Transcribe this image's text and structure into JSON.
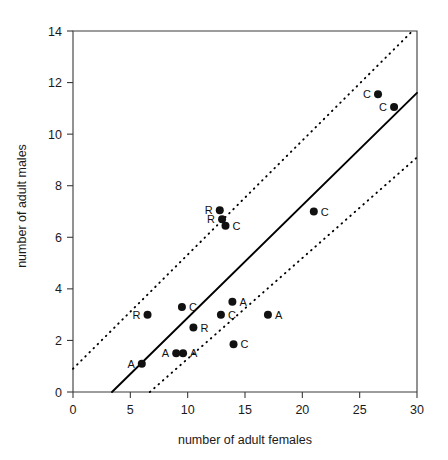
{
  "chart_data": {
    "type": "scatter",
    "title": "",
    "xlabel": "number of adult females",
    "ylabel": "number of adult males",
    "xlim": [
      0,
      30
    ],
    "ylim": [
      0,
      14
    ],
    "xticks": [
      0,
      5,
      10,
      15,
      20,
      25,
      30
    ],
    "yticks": [
      0,
      2,
      4,
      6,
      8,
      10,
      12,
      14
    ],
    "xtick_labels": [
      "0",
      "5",
      "10",
      "15",
      "20",
      "25",
      "30"
    ],
    "ytick_labels": [
      "0",
      "2",
      "4",
      "6",
      "8",
      "10",
      "12",
      "14"
    ],
    "grid": false,
    "legend": "none",
    "points": [
      {
        "x": 6.0,
        "y": 1.1,
        "label": "A",
        "label_side": "left"
      },
      {
        "x": 6.5,
        "y": 3.0,
        "label": "R",
        "label_side": "left"
      },
      {
        "x": 9.0,
        "y": 1.5,
        "label": "A",
        "label_side": "left"
      },
      {
        "x": 9.6,
        "y": 1.5,
        "label": "A",
        "label_side": "right"
      },
      {
        "x": 9.5,
        "y": 3.3,
        "label": "C",
        "label_side": "right"
      },
      {
        "x": 10.5,
        "y": 2.5,
        "label": "R",
        "label_side": "right"
      },
      {
        "x": 12.8,
        "y": 7.05,
        "label": "R",
        "label_side": "left"
      },
      {
        "x": 13.0,
        "y": 6.7,
        "label": "R",
        "label_side": "left"
      },
      {
        "x": 13.3,
        "y": 6.45,
        "label": "C",
        "label_side": "right"
      },
      {
        "x": 12.9,
        "y": 3.0,
        "label": "C",
        "label_side": "right"
      },
      {
        "x": 13.9,
        "y": 3.5,
        "label": "A",
        "label_side": "right"
      },
      {
        "x": 14.0,
        "y": 1.85,
        "label": "C",
        "label_side": "right"
      },
      {
        "x": 17.0,
        "y": 3.0,
        "label": "A",
        "label_side": "right"
      },
      {
        "x": 21.0,
        "y": 7.0,
        "label": "C",
        "label_side": "right"
      },
      {
        "x": 26.6,
        "y": 11.55,
        "label": "C",
        "label_side": "left"
      },
      {
        "x": 28.0,
        "y": 11.05,
        "label": "C",
        "label_side": "left"
      }
    ],
    "fit_line": {
      "name": "regression line",
      "style": "solid",
      "x_start": 3.4,
      "y_start": 0.0,
      "x_end": 30.0,
      "y_end": 11.6
    },
    "confidence_bands": [
      {
        "name": "upper confidence band",
        "style": "dotted",
        "x_start": 0.0,
        "y_start": 0.9,
        "x_end": 29.6,
        "y_end": 14.0
      },
      {
        "name": "lower confidence band",
        "style": "dotted",
        "x_start": 6.7,
        "y_start": 0.0,
        "x_end": 30.0,
        "y_end": 9.1
      }
    ]
  }
}
